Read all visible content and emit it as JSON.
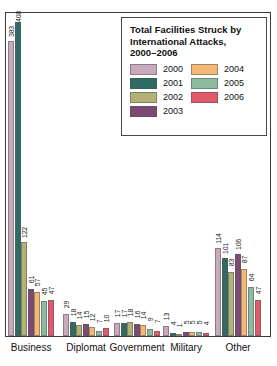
{
  "legend": {
    "title_lines": [
      "Total Facilities Struck by",
      "International Attacks,",
      "2000–2006"
    ],
    "title_full": "Total Facilities Struck by International Attacks, 2000–2006",
    "entries_left": [
      {
        "label": "2000",
        "color": "#c9a9bd"
      },
      {
        "label": "2001",
        "color": "#2e6b63"
      },
      {
        "label": "2002",
        "color": "#b3b276"
      },
      {
        "label": "2003",
        "color": "#7c4a72"
      }
    ],
    "entries_right": [
      {
        "label": "2004",
        "color": "#f5b878"
      },
      {
        "label": "2005",
        "color": "#8dbaa0"
      },
      {
        "label": "2006",
        "color": "#e2596b"
      }
    ]
  },
  "chart_data": {
    "type": "bar",
    "xlabel": "",
    "ylabel": "",
    "ylim": [
      0,
      420
    ],
    "grid": false,
    "legend_position": "top-right",
    "categories": [
      "Business",
      "Diplomat",
      "Government",
      "Military",
      "Other"
    ],
    "series": [
      {
        "name": "2000",
        "color": "#c9a9bd",
        "values": [
          383,
          29,
          17,
          13,
          114
        ]
      },
      {
        "name": "2001",
        "color": "#2e6b63",
        "values": [
          408,
          18,
          17,
          4,
          101
        ]
      },
      {
        "name": "2002",
        "color": "#b3b276",
        "values": [
          122,
          14,
          18,
          1,
          83
        ]
      },
      {
        "name": "2003",
        "color": "#7c4a72",
        "values": [
          61,
          15,
          16,
          5,
          106
        ]
      },
      {
        "name": "2004",
        "color": "#f5b878",
        "values": [
          57,
          12,
          14,
          5,
          87
        ]
      },
      {
        "name": "2005",
        "color": "#8dbaa0",
        "values": [
          45,
          7,
          9,
          5,
          64
        ]
      },
      {
        "name": "2006",
        "color": "#e2596b",
        "values": [
          47,
          10,
          7,
          4,
          47
        ]
      }
    ]
  }
}
